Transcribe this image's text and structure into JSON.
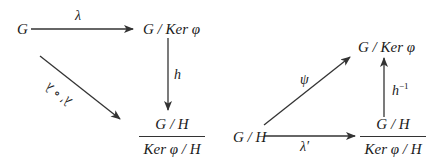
{
  "left_diagram": {
    "nodes": {
      "G": "G",
      "quotient_ker": "G / Ker φ",
      "frac_num": "G / H",
      "frac_den": "Ker φ / H"
    },
    "arrows": {
      "top": "λ",
      "right": "h",
      "diagonal": "λ′ ∘ λ"
    }
  },
  "right_diagram": {
    "nodes": {
      "quotient_ker": "G / Ker φ",
      "GH": "G / H",
      "frac_num": "G / H",
      "frac_den": "Ker φ / H"
    },
    "arrows": {
      "diagonal": "ψ",
      "right": "h",
      "right_sup": "−1",
      "bottom": "λ′"
    }
  },
  "colors": {
    "stroke": "#333333",
    "text": "#1a1a1a",
    "background": "#ffffff"
  }
}
